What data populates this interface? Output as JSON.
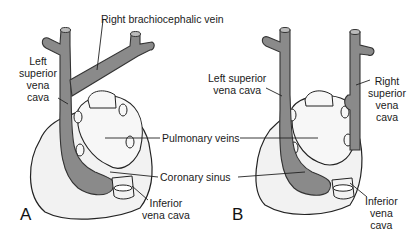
{
  "figure": {
    "type": "anatomical-diagram",
    "colors": {
      "vein": "#8a8a8a",
      "vein_outline": "#333333",
      "heart": "#f2f2f2",
      "heart_outline": "#222222",
      "background": "#ffffff"
    },
    "labels": {
      "right_brachiocephalic_vein": "Right brachiocephalic vein",
      "a_left_svc": "Left\nsuperior\nvena\ncava",
      "pulmonary_veins": "Pulmonary veins",
      "coronary_sinus": "Coronary sinus",
      "a_ivc": "Inferior\nvena cava",
      "b_left_svc": "Left superior\nvena cava",
      "b_right_svc": "Right\nsuperior\nvena\ncava",
      "b_ivc": "Inferior\nvena\ncava"
    },
    "panels": {
      "a": "A",
      "b": "B"
    }
  }
}
